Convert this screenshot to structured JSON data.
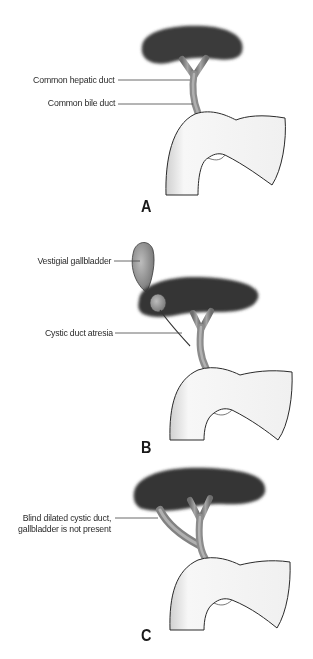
{
  "figure": {
    "panels": [
      {
        "letter": "A",
        "labels": [
          {
            "text": "Common hepatic duct"
          },
          {
            "text": "Common bile duct"
          }
        ]
      },
      {
        "letter": "B",
        "labels": [
          {
            "text": "Vestigial gallbladder"
          },
          {
            "text": "Cystic duct atresia"
          }
        ]
      },
      {
        "letter": "C",
        "labels": [
          {
            "line1": "Blind dilated cystic duct,",
            "line2": "gallbladder is not present"
          }
        ]
      }
    ],
    "colors": {
      "liver": "#3c3c3c",
      "duct": "#8a8a8a",
      "duodenum_fill": "#f2f2f2",
      "outline": "#2a2a2a",
      "leader_line": "#444444"
    }
  }
}
